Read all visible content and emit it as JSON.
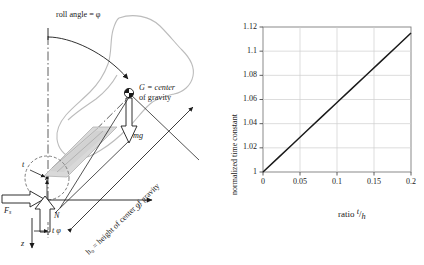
{
  "figure": {
    "panels": [
      "vehicle-roll-free-body-diagram",
      "normalized-time-constant-plot"
    ]
  },
  "diagram": {
    "title_annotation": "roll angle = φ",
    "cg_label_line1": "G = center",
    "cg_label_line2": "of gravity",
    "weight_vector_label": "mg",
    "normal_force_label": "N",
    "side_force_label_base": "F",
    "side_force_label_sub": "s",
    "axis_y_label": "y",
    "axis_z_label": "z",
    "axis_t_label": "t",
    "tire_offset_label": "t φ",
    "height_annotation": "h₀ = height of center of gravity",
    "colors": {
      "ink": "#1a1a1a",
      "vehicle_outline": "#b9b9b9",
      "tire_fill": "#d8d8d8",
      "tire_stroke": "#8e8e8e",
      "centerline": "#5a5a5a"
    }
  },
  "chart_data": {
    "type": "line",
    "title": "",
    "xlabel": "ratio t/h",
    "xlabel_parts": {
      "word": "ratio",
      "numerator": "t",
      "denominator": "h"
    },
    "ylabel": "normalized time constant",
    "xlim": [
      0,
      0.2
    ],
    "ylim": [
      1,
      1.12
    ],
    "xticks": [
      0,
      0.05,
      0.1,
      0.15,
      0.2
    ],
    "xticklabels": [
      "0",
      "0.05",
      "0.1",
      "0.15",
      "0.2"
    ],
    "yticks": [
      1,
      1.02,
      1.04,
      1.06,
      1.08,
      1.1,
      1.12
    ],
    "yticklabels": [
      "1",
      "1.02",
      "1.04",
      "1.06",
      "1.08",
      "1.1",
      "1.12"
    ],
    "grid": true,
    "legend": "none",
    "series": [
      {
        "name": "normalized time constant",
        "color": "#1a1a1a",
        "x": [
          0,
          0.02,
          0.04,
          0.06,
          0.08,
          0.1,
          0.12,
          0.14,
          0.16,
          0.18,
          0.2
        ],
        "y": [
          1.0,
          1.0115,
          1.023,
          1.0345,
          1.046,
          1.0575,
          1.069,
          1.0805,
          1.092,
          1.1035,
          1.115
        ]
      }
    ]
  }
}
